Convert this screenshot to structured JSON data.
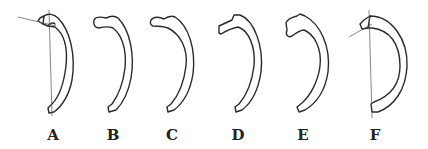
{
  "figure": {
    "panels": [
      {
        "label": "A",
        "guide_lines": true
      },
      {
        "label": "B",
        "guide_lines": false
      },
      {
        "label": "C",
        "guide_lines": false
      },
      {
        "label": "D",
        "guide_lines": false
      },
      {
        "label": "E",
        "guide_lines": false
      },
      {
        "label": "F",
        "guide_lines": true
      }
    ]
  }
}
